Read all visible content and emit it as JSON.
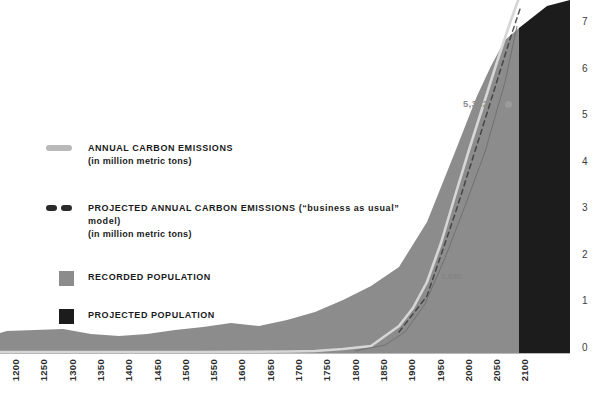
{
  "chart_data": {
    "type": "area",
    "title": "",
    "subtitle": "",
    "xlabel": "",
    "ylabel": "",
    "xlim": [
      1200,
      2100
    ],
    "ylim": [
      0,
      7.5
    ],
    "grid": false,
    "legend_position": "inside-left",
    "x_ticks": [
      "1200",
      "1250",
      "1300",
      "1350",
      "1400",
      "1450",
      "1500",
      "1550",
      "1600",
      "1650",
      "1700",
      "1750",
      "1800",
      "1850",
      "1900",
      "1950",
      "2000",
      "2050",
      "2100"
    ],
    "y_ticks": [
      "0",
      "1",
      "2",
      "3",
      "4",
      "5",
      "6",
      "7"
    ],
    "series": [
      {
        "name": "RECORDED POPULATION",
        "type": "area",
        "color": "#8c8c8c",
        "units": "billions",
        "x": [
          1200,
          1250,
          1300,
          1350,
          1400,
          1450,
          1500,
          1550,
          1600,
          1650,
          1700,
          1750,
          1800,
          1850,
          1900,
          1950,
          1975,
          2000
        ],
        "values": [
          0.4,
          0.42,
          0.43,
          0.37,
          0.35,
          0.38,
          0.44,
          0.48,
          0.53,
          0.5,
          0.58,
          0.72,
          0.98,
          1.26,
          1.65,
          2.52,
          4.07,
          6.08
        ]
      },
      {
        "name": "PROJECTED POPULATION",
        "type": "area",
        "color": "#1c1c1c",
        "units": "billions",
        "x": [
          2000,
          2025,
          2050,
          2075,
          2100
        ],
        "values": [
          6.08,
          8.18,
          9.55,
          10.4,
          10.9
        ]
      },
      {
        "name": "ANNUAL CARBON EMISSIONS",
        "type": "line",
        "color": "#d6d6d6",
        "units": "million metric tons",
        "x": [
          1200,
          1400,
          1600,
          1700,
          1750,
          1800,
          1850,
          1900,
          1925,
          1950,
          1960,
          1970,
          1980,
          1990,
          2000
        ],
        "values": [
          0,
          0,
          0,
          0,
          3,
          30,
          54,
          534,
          975,
          1630,
          2577,
          4053,
          5332,
          6143,
          6765
        ]
      },
      {
        "name": "PROJECTED ANNUAL CARBON EMISSIONS",
        "type": "line-dashed",
        "color": "#2a2a2a",
        "units": "million metric tons",
        "x": [
          2000,
          2025,
          2050,
          2075,
          2100
        ],
        "values": [
          6765,
          9500,
          12500,
          15500,
          18000
        ]
      }
    ],
    "annotations": [
      {
        "label": "5,332",
        "x": 1980,
        "y_axis_value": 5.15,
        "marker": "dot",
        "color": "#8e8e8e"
      },
      {
        "label": "1,630",
        "x": 1950,
        "y_axis_value": 1.62,
        "marker": "none",
        "color": "#7d7d7d"
      }
    ]
  },
  "legend": {
    "items": [
      {
        "key": "annual-carbon-emissions",
        "swatch": "line-swatch",
        "label": "ANNUAL CARBON EMISSIONS",
        "sublabel": "(in million metric tons)"
      },
      {
        "key": "projected-annual-carbon-emissions",
        "swatch": "dashed-line-swatch",
        "label": "PROJECTED ANNUAL CARBON EMISSIONS (“business as usual” model)",
        "sublabel": "(in million metric tons)"
      },
      {
        "key": "recorded-population",
        "swatch": "box-swatch-gray",
        "label": "RECORDED POPULATION",
        "sublabel": ""
      },
      {
        "key": "projected-population",
        "swatch": "box-swatch-black",
        "label": "PROJECTED POPULATION",
        "sublabel": ""
      }
    ]
  },
  "colors": {
    "recorded_population": "#8c8c8c",
    "projected_population": "#1c1c1c",
    "emissions_line": "#d6d6d6",
    "projected_emissions_line": "#2a2a2a",
    "axis_text": "#2b2b2b",
    "background": "#ffffff"
  }
}
